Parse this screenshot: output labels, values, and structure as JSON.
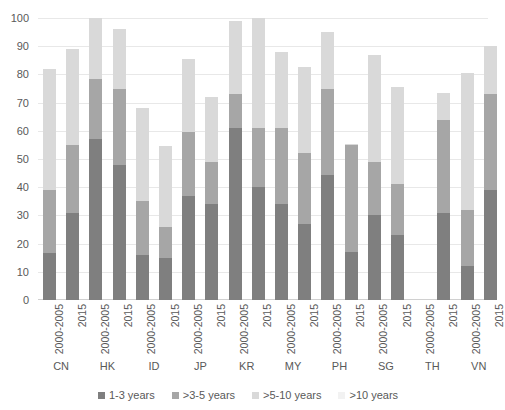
{
  "chart_data": {
    "type": "bar",
    "subtype": "stacked-bar",
    "title": "",
    "xlabel": "",
    "ylabel": "",
    "ylim": [
      0,
      100
    ],
    "yticks": [
      0,
      10,
      20,
      30,
      40,
      50,
      60,
      70,
      80,
      90,
      100
    ],
    "grid": true,
    "legend_position": "bottom",
    "stacked_total_note": "Segments stack bottom-to-top in legend order",
    "categories": [
      "CN 2000-2005",
      "CN 2015",
      "HK 2000-2005",
      "HK 2015",
      "ID 2000-2005",
      "ID 2015",
      "JP 2000-2005",
      "JP 2015",
      "KR 2000-2005",
      "KR 2015",
      "MY 2000-2005",
      "MY 2015",
      "PH 2000-2005",
      "PH 2015",
      "SG 2000-2005",
      "SG 2015",
      "TH 2000-2005",
      "TH 2015",
      "VN 2000-2005",
      "VN 2015"
    ],
    "groups": [
      {
        "code": "CN",
        "periods": [
          "2000-2005",
          "2015"
        ]
      },
      {
        "code": "HK",
        "periods": [
          "2000-2005",
          "2015"
        ]
      },
      {
        "code": "ID",
        "periods": [
          "2000-2005",
          "2015"
        ]
      },
      {
        "code": "JP",
        "periods": [
          "2000-2005",
          "2015"
        ]
      },
      {
        "code": "KR",
        "periods": [
          "2000-2005",
          "2015"
        ]
      },
      {
        "code": "MY",
        "periods": [
          "2000-2005",
          "2015"
        ]
      },
      {
        "code": "PH",
        "periods": [
          "2000-2005",
          "2015"
        ]
      },
      {
        "code": "SG",
        "periods": [
          "2000-2005",
          "2015"
        ]
      },
      {
        "code": "TH",
        "periods": [
          "2000-2005",
          "2015"
        ]
      },
      {
        "code": "VN",
        "periods": [
          "2000-2005",
          "2015"
        ]
      }
    ],
    "series": [
      {
        "name": "1-3 years",
        "color": "#7f7f7f",
        "values": [
          16.5,
          31,
          57,
          48,
          16,
          15,
          37,
          34,
          61,
          40,
          34,
          27,
          44.5,
          17,
          30,
          23,
          0,
          31,
          12,
          39
        ]
      },
      {
        "name": ">3-5 years",
        "color": "#a6a6a6",
        "values": [
          22.5,
          24,
          21.5,
          27,
          19,
          11,
          22.5,
          15,
          12,
          21,
          27,
          25,
          30.5,
          38,
          19,
          18,
          0,
          33,
          20,
          34
        ]
      },
      {
        "name": ">5-10 years",
        "color": "#d9d9d9",
        "values": [
          43,
          34,
          21.5,
          21,
          33,
          28.5,
          26,
          23,
          26,
          39,
          27,
          30.5,
          20,
          0.5,
          38,
          34.5,
          0,
          9.5,
          48.5,
          17
        ]
      },
      {
        "name": ">10 years",
        "color": "#f2f2f2",
        "values": [
          0,
          0,
          0,
          0,
          0,
          0,
          0,
          0,
          0,
          0,
          0,
          0,
          0,
          0,
          0,
          0,
          0,
          0,
          0,
          0
        ]
      }
    ],
    "totals": [
      82,
      89,
      100,
      96,
      68,
      54.5,
      85.5,
      72,
      99,
      100,
      88,
      82.5,
      95,
      55.5,
      87,
      75.5,
      0,
      73.5,
      80.5,
      90
    ],
    "bar_labels": [
      "2000-2005",
      "2015",
      "2000-2005",
      "2015",
      "2000-2005",
      "2015",
      "2000-2005",
      "2015",
      "2000-2005",
      "2015",
      "2000-2005",
      "2015",
      "2000-2005",
      "2015",
      "2000-2005",
      "2015",
      "2000-2005",
      "2015",
      "2000-2005",
      "2015"
    ]
  },
  "legend": {
    "items": [
      {
        "label": "1-3 years",
        "color": "#7f7f7f"
      },
      {
        "label": ">3-5 years",
        "color": "#a6a6a6"
      },
      {
        "label": ">5-10 years",
        "color": "#d9d9d9"
      },
      {
        "label": ">10 years",
        "color": "#f2f2f2"
      }
    ]
  },
  "colors": {
    "gridline": "#e8e8e8",
    "text": "#595959",
    "background": "#ffffff"
  }
}
